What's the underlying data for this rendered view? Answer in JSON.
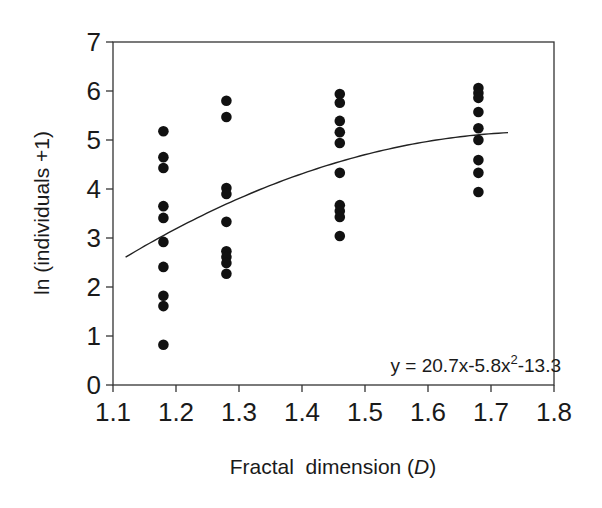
{
  "chart_data": {
    "type": "scatter",
    "title": "",
    "xlabel": "Fractal  dimension",
    "xlabel_italic": "D",
    "ylabel": "ln (individuals +1)",
    "xlim": [
      1.1,
      1.8
    ],
    "ylim": [
      0,
      7
    ],
    "x_ticks": [
      "1.1",
      "1.2",
      "1.3",
      "1.4",
      "1.5",
      "1.6",
      "1.7",
      "1.8"
    ],
    "y_ticks": [
      "0",
      "1",
      "2",
      "3",
      "4",
      "5",
      "6",
      "7"
    ],
    "grid": false,
    "legend": null,
    "series": [
      {
        "name": "observations",
        "marker": "filled-circle",
        "color": "#111111",
        "points": [
          {
            "x": 1.18,
            "y": 5.18
          },
          {
            "x": 1.18,
            "y": 4.65
          },
          {
            "x": 1.18,
            "y": 4.43
          },
          {
            "x": 1.18,
            "y": 3.65
          },
          {
            "x": 1.18,
            "y": 3.41
          },
          {
            "x": 1.18,
            "y": 2.92
          },
          {
            "x": 1.18,
            "y": 2.41
          },
          {
            "x": 1.18,
            "y": 1.82
          },
          {
            "x": 1.18,
            "y": 1.61
          },
          {
            "x": 1.18,
            "y": 0.82
          },
          {
            "x": 1.28,
            "y": 5.8
          },
          {
            "x": 1.28,
            "y": 5.47
          },
          {
            "x": 1.28,
            "y": 4.02
          },
          {
            "x": 1.28,
            "y": 3.9
          },
          {
            "x": 1.28,
            "y": 3.33
          },
          {
            "x": 1.28,
            "y": 2.73
          },
          {
            "x": 1.28,
            "y": 2.61
          },
          {
            "x": 1.28,
            "y": 2.49
          },
          {
            "x": 1.28,
            "y": 2.27
          },
          {
            "x": 1.46,
            "y": 5.94
          },
          {
            "x": 1.46,
            "y": 5.76
          },
          {
            "x": 1.46,
            "y": 5.39
          },
          {
            "x": 1.46,
            "y": 5.16
          },
          {
            "x": 1.46,
            "y": 4.94
          },
          {
            "x": 1.46,
            "y": 4.33
          },
          {
            "x": 1.46,
            "y": 3.67
          },
          {
            "x": 1.46,
            "y": 3.55
          },
          {
            "x": 1.46,
            "y": 3.43
          },
          {
            "x": 1.46,
            "y": 3.04
          },
          {
            "x": 1.68,
            "y": 6.06
          },
          {
            "x": 1.68,
            "y": 5.96
          },
          {
            "x": 1.68,
            "y": 5.86
          },
          {
            "x": 1.68,
            "y": 5.57
          },
          {
            "x": 1.68,
            "y": 5.24
          },
          {
            "x": 1.68,
            "y": 5.0
          },
          {
            "x": 1.68,
            "y": 4.59
          },
          {
            "x": 1.68,
            "y": 4.33
          },
          {
            "x": 1.68,
            "y": 3.94
          }
        ]
      }
    ],
    "fit": {
      "type": "quadratic",
      "equation_label": "y = 20.7x-5.8x",
      "equation_sup": "2",
      "equation_tail": "-13.3",
      "coefficients": {
        "a": -5.8,
        "b": 20.7,
        "c": -13.3
      },
      "x_range": [
        1.12,
        1.727
      ],
      "color": "#222222"
    }
  }
}
